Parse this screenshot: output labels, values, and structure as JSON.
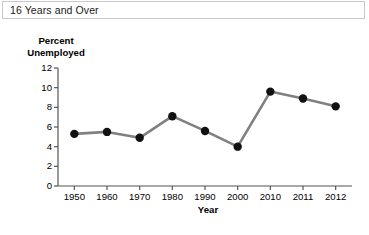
{
  "header": {
    "title": "16 Years and Over"
  },
  "chart_data": {
    "type": "line",
    "title": "",
    "subtitle": "",
    "xlabel": "Year",
    "ylabel": "Percent\nUnemployed",
    "categories": [
      "1950",
      "1960",
      "1970",
      "1980",
      "1990",
      "2000",
      "2010",
      "2011",
      "2012"
    ],
    "values": [
      5.3,
      5.5,
      4.9,
      7.1,
      5.6,
      4.0,
      9.6,
      8.9,
      8.1
    ],
    "series": [
      {
        "name": "Percent Unemployed",
        "values": [
          5.3,
          5.5,
          4.9,
          7.1,
          5.6,
          4.0,
          9.6,
          8.9,
          8.1
        ]
      }
    ],
    "ylim": [
      0,
      12
    ],
    "yticks": [
      0,
      2,
      4,
      6,
      8,
      10,
      12
    ],
    "ytick_labels": [
      "0",
      "2",
      "4",
      "6",
      "8",
      "10",
      "12"
    ],
    "xtick_labels": [
      "1950",
      "1960",
      "1970",
      "1980",
      "1990",
      "2000",
      "2010",
      "2011",
      "2012"
    ],
    "grid": false,
    "legend": "none",
    "marker": "filled-circle",
    "colors": {
      "line": "#808080",
      "marker": "#111111",
      "axis": "#555555",
      "background": "#ffffff"
    }
  }
}
